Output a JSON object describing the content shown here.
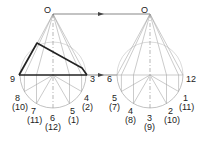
{
  "diagram": {
    "type": "development-projection",
    "left_view": {
      "apex_label": "O",
      "base_points": [
        {
          "label": "9",
          "sub": ""
        },
        {
          "label": "8",
          "sub": "(10)"
        },
        {
          "label": "7",
          "sub": "(11)"
        },
        {
          "label": "6",
          "sub": "(12)"
        },
        {
          "label": "5",
          "sub": "(1)"
        },
        {
          "label": "4",
          "sub": "(2)"
        },
        {
          "label": "3",
          "sub": ""
        }
      ]
    },
    "right_view": {
      "apex_label": "O",
      "base_points": [
        {
          "label": "6",
          "sub": ""
        },
        {
          "label": "5",
          "sub": "(7)"
        },
        {
          "label": "4",
          "sub": "(8)"
        },
        {
          "label": "3",
          "sub": "(9)"
        },
        {
          "label": "2",
          "sub": "(10)"
        },
        {
          "label": "1",
          "sub": "(11)"
        },
        {
          "label": "12",
          "sub": ""
        }
      ]
    },
    "colors": {
      "construction_line": "#a8a8a8",
      "outline": "#222222",
      "text": "#222222"
    }
  }
}
